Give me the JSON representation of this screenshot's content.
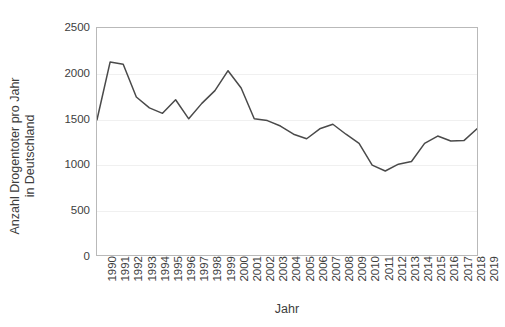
{
  "chart_data": {
    "type": "line",
    "title": "",
    "xlabel": "Jahr",
    "ylabel": "Anzahl Drogentoter pro Jahr in Deutschland",
    "ylabel_line1": "Anzahl Drogentoter pro Jahr",
    "ylabel_line2": "in Deutschland",
    "grid": true,
    "legend": "none",
    "line_color": "#4a4a4a",
    "frame_color": "#b9b9b9",
    "gridline_color": "#f0f0f0",
    "background_color": "#ffffff",
    "xlim": [
      1990,
      2019
    ],
    "ylim": [
      0,
      2500
    ],
    "ytick_labels": [
      "2500",
      "2000",
      "1500",
      "1000",
      "500",
      "0"
    ],
    "ytick_values": [
      2500,
      2000,
      1500,
      1000,
      500,
      0
    ],
    "categories": [
      "1990",
      "1991",
      "1992",
      "1993",
      "1994",
      "1995",
      "1996",
      "1997",
      "1998",
      "1999",
      "2000",
      "2001",
      "2002",
      "2003",
      "2004",
      "2005",
      "2006",
      "2007",
      "2008",
      "2009",
      "2010",
      "2011",
      "2012",
      "2013",
      "2014",
      "2015",
      "2016",
      "2017",
      "2018",
      "2019"
    ],
    "x": [
      1990,
      1991,
      1992,
      1993,
      1994,
      1995,
      1996,
      1997,
      1998,
      1999,
      2000,
      2001,
      2002,
      2003,
      2004,
      2005,
      2006,
      2007,
      2008,
      2009,
      2010,
      2011,
      2012,
      2013,
      2014,
      2015,
      2016,
      2017,
      2018,
      2019
    ],
    "values": [
      1490,
      2125,
      2100,
      1740,
      1620,
      1560,
      1710,
      1500,
      1670,
      1810,
      2030,
      1840,
      1500,
      1480,
      1420,
      1330,
      1280,
      1390,
      1440,
      1330,
      1230,
      990,
      925,
      1000,
      1030,
      1230,
      1310,
      1255,
      1260,
      1390
    ]
  }
}
